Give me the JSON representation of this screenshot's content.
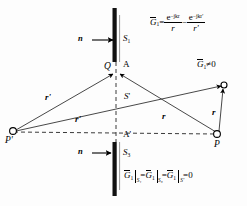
{
  "figure": {
    "type": "optics-diffraction-geometry-diagram",
    "background_color": "#fdfdfd",
    "ink_color": "#000000"
  },
  "labels": {
    "normal_top": "n",
    "normal_bottom": "n",
    "screen_top": "S",
    "screen_top_sub": "1",
    "screen_bottom": "S",
    "screen_bottom_sub": "3",
    "aperture_plane": "S",
    "aperture_plane_prime": "'",
    "point_Q": "Q",
    "point_A": "A",
    "point_A_prime": "A'",
    "point_P": "P",
    "point_P_prime": "P'",
    "vector_r": "r",
    "vector_r_right": "r",
    "vector_r_prime_upper": "r'",
    "vector_r_prime_lower": "r'",
    "green_nonzero": "G",
    "green_nonzero_sub": "1",
    "green_nonzero_rel": "≠0"
  },
  "equations": {
    "top": {
      "lhs": "G",
      "lhs_sub": "1",
      "eq": "=",
      "term1_num": "e",
      "term1_num_sup": "−jkr",
      "term1_den": "r",
      "minus": "−",
      "term2_num": "e",
      "term2_num_sup": "−jkr'",
      "term2_den": "r'",
      "plain": "G₁ = e^(−jkr)/r − e^(−jkr')/r'"
    },
    "bottom": {
      "g": "G",
      "g_sub": "1",
      "restr1": "S₁",
      "eq1": "=",
      "restr2": "S₃",
      "eq2": "=",
      "restr3": "S'",
      "eq3": "=",
      "zero": "0",
      "plain": "G₁|S₁ = G₁|S₃ = G₁|S' = 0"
    }
  },
  "geometry": {
    "screen_top": {
      "x": 116,
      "y_top": 8,
      "y_bottom": 62
    },
    "screen_bottom": {
      "x": 116,
      "y_top": 142,
      "y_bottom": 196
    },
    "aperture_Q": {
      "x": 116,
      "y": 72
    },
    "aperture_A_prime": {
      "x": 116,
      "y": 135
    },
    "point_P": {
      "x": 217,
      "y": 134
    },
    "point_P_prime": {
      "x": 12,
      "y": 129
    },
    "point_image": {
      "x": 224,
      "y": 85
    },
    "axis_y": 133
  }
}
